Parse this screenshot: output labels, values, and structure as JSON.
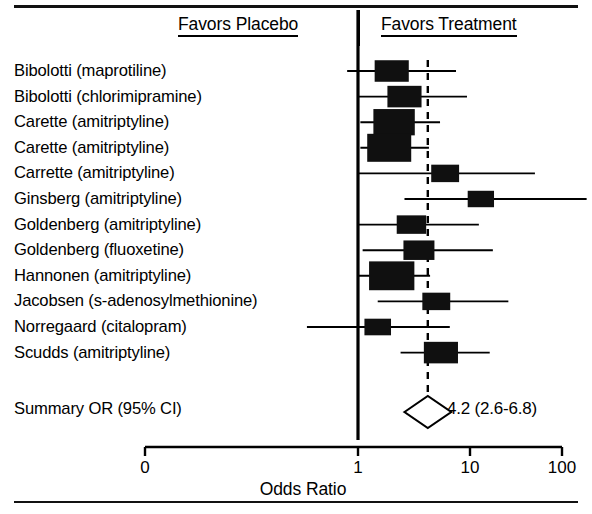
{
  "figure": {
    "type": "forest-plot",
    "header_left": "Favors Placebo",
    "header_right": "Favors Treatment",
    "summary_row_label": "Summary OR (95% CI)",
    "summary_row_value": "4.2 (2.6-6.8)"
  },
  "axis": {
    "title": "Odds Ratio",
    "tick_labels": [
      "0",
      "1",
      "10",
      "100"
    ],
    "tick_values": [
      0,
      1,
      10,
      100
    ],
    "tick_px": [
      145,
      358,
      470,
      562
    ],
    "scale": "log",
    "null_value": 1,
    "null_line_px": 358,
    "summary_line_px": 400
  },
  "chart_data": {
    "type": "forest",
    "title": "",
    "xlabel": "Odds Ratio",
    "ylabel": "",
    "xscale": "log",
    "xticks": [
      0,
      1,
      10,
      100
    ],
    "xtick_labels": [
      "0",
      "1",
      "10",
      "100"
    ],
    "reference_line": 1,
    "summary_line": 4.2,
    "grid": false,
    "legend": "none",
    "annotations": [
      "Favors Placebo",
      "Favors Treatment"
    ],
    "studies": [
      {
        "label": "Bibolotti (maprotiline)",
        "or": 2.0,
        "ci_low": 0.8,
        "ci_high": 7.5,
        "weight": 0.62
      },
      {
        "label": "Bibolotti (chlorimipramine)",
        "or": 2.6,
        "ci_low": 1.0,
        "ci_high": 9.4,
        "weight": 0.62
      },
      {
        "label": "Carette (amitriptyline)",
        "or": 2.1,
        "ci_low": 1.05,
        "ci_high": 5.4,
        "weight": 0.9
      },
      {
        "label": "Carette (amitriptyline)",
        "or": 1.9,
        "ci_low": 1.05,
        "ci_high": 4.3,
        "weight": 1.0
      },
      {
        "label": "Carrette (amitriptyline)",
        "or": 6.0,
        "ci_low": 1.0,
        "ci_high": 38.0,
        "weight": 0.38
      },
      {
        "label": "Ginsberg (amitriptyline)",
        "or": 12.5,
        "ci_low": 2.6,
        "ci_high": 110.0,
        "weight": 0.32
      },
      {
        "label": "Goldenberg (amitriptyline)",
        "or": 3.0,
        "ci_low": 1.0,
        "ci_high": 12.0,
        "weight": 0.44
      },
      {
        "label": "Goldenberg (fluoxetine)",
        "or": 3.5,
        "ci_low": 1.1,
        "ci_high": 16.0,
        "weight": 0.5
      },
      {
        "label": "Hannonen (amitriptyline)",
        "or": 2.0,
        "ci_low": 1.0,
        "ci_high": 4.4,
        "weight": 1.05
      },
      {
        "label": "Jacobsen (s-adenosylmethionine)",
        "or": 5.0,
        "ci_low": 1.5,
        "ci_high": 22.0,
        "weight": 0.38
      },
      {
        "label": "Norregaard (citalopram)",
        "or": 1.5,
        "ci_low": 0.35,
        "ci_high": 6.6,
        "weight": 0.33
      },
      {
        "label": "Scudds (amitriptyline)",
        "or": 5.5,
        "ci_low": 2.4,
        "ci_high": 15.0,
        "weight": 0.62
      }
    ],
    "summary": {
      "label": "Summary OR (95% CI)",
      "or": 4.2,
      "ci_low": 2.6,
      "ci_high": 6.8,
      "value_text": "4.2 (2.6-6.8)"
    }
  },
  "colors": {
    "ink": "#000000",
    "background": "#ffffff",
    "marker_fill": "#101010"
  }
}
